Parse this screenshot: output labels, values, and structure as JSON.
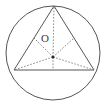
{
  "figure": {
    "type": "geometry-diagram",
    "background_color": "#ffffff",
    "stroke_color": "#555555",
    "dotted_color": "#7a7a7a",
    "label_color": "#3a3a3a",
    "width": 107,
    "height": 106
  },
  "circle": {
    "name": "circumscribed-circle",
    "center_x": 53,
    "center_y": 53,
    "radius": 47,
    "stroke_width": 1
  },
  "triangle": {
    "name": "inscribed-triangle",
    "apex": {
      "x": 54,
      "y": 6
    },
    "base_left": {
      "x": 14,
      "y": 70
    },
    "base_right": {
      "x": 94,
      "y": 70
    },
    "stroke_width": 1
  },
  "center_point": {
    "label": "O",
    "x": 53,
    "y": 57,
    "dot_radius": 1.6
  },
  "dotted_segments": [
    {
      "name": "center-to-apex",
      "x1": 53,
      "y1": 57,
      "x2": 54,
      "y2": 6
    },
    {
      "name": "center-to-base-left",
      "x1": 53,
      "y1": 57,
      "x2": 14,
      "y2": 70
    },
    {
      "name": "center-to-base-right",
      "x1": 53,
      "y1": 57,
      "x2": 94,
      "y2": 70
    },
    {
      "name": "center-to-left-side-midpoint",
      "x1": 53,
      "y1": 57,
      "x2": 34,
      "y2": 38
    },
    {
      "name": "center-to-right-side-midpoint",
      "x1": 53,
      "y1": 57,
      "x2": 74,
      "y2": 38
    },
    {
      "name": "center-to-base-midpoint",
      "x1": 53,
      "y1": 57,
      "x2": 53,
      "y2": 70
    }
  ]
}
